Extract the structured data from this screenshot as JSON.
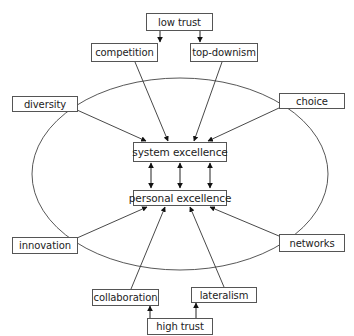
{
  "diagram": {
    "nodes": {
      "low_trust": "low trust",
      "competition": "competition",
      "top_downism": "top-downism",
      "diversity": "diversity",
      "choice": "choice",
      "system_excellence": "system excellence",
      "personal_excellence": "personal excellence",
      "innovation": "innovation",
      "networks": "networks",
      "collaboration": "collaboration",
      "lateralism": "lateralism",
      "high_trust": "high trust"
    },
    "edges": [
      {
        "from": "low trust",
        "to": "competition"
      },
      {
        "from": "low trust",
        "to": "top-downism"
      },
      {
        "from": "competition",
        "to": "system excellence"
      },
      {
        "from": "top-downism",
        "to": "system excellence"
      },
      {
        "from": "diversity",
        "to": "system excellence"
      },
      {
        "from": "choice",
        "to": "system excellence"
      },
      {
        "from": "system excellence",
        "to": "personal excellence",
        "bidirectional": true,
        "count": 3
      },
      {
        "from": "innovation",
        "to": "personal excellence"
      },
      {
        "from": "collaboration",
        "to": "personal excellence"
      },
      {
        "from": "lateralism",
        "to": "personal excellence"
      },
      {
        "from": "networks",
        "to": "personal excellence"
      },
      {
        "from": "high trust",
        "to": "collaboration"
      },
      {
        "from": "high trust",
        "to": "lateralism"
      }
    ],
    "colors": {
      "line": "#333333",
      "box_border": "#555555",
      "background": "#ffffff",
      "text": "#222222"
    }
  }
}
